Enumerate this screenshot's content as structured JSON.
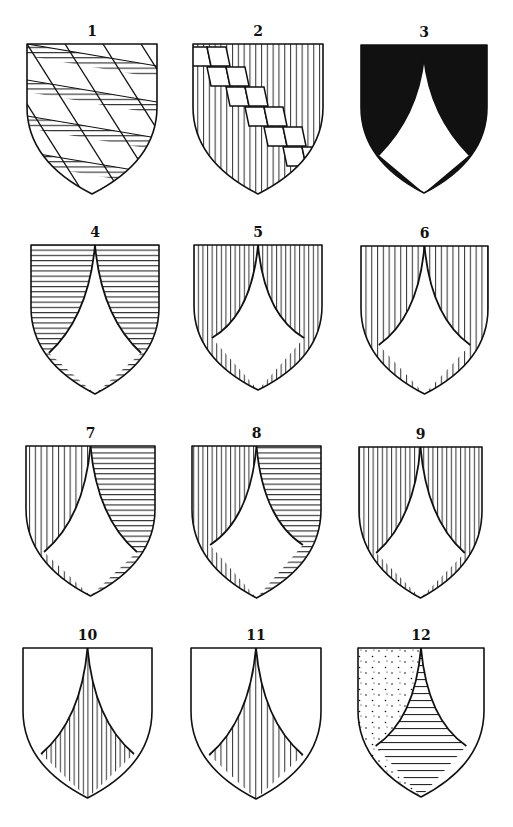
{
  "figure": {
    "ink": "#111111",
    "paper": "#ffffff",
    "shields": [
      {
        "id": 1,
        "label": "1",
        "x": 27,
        "y": 44,
        "w": 130,
        "h": 150,
        "design": "bendy-lozengy",
        "tincture": "horizontal-hatching"
      },
      {
        "id": 2,
        "label": "2",
        "x": 193,
        "y": 44,
        "w": 130,
        "h": 150,
        "design": "bend-lozengy",
        "tincture": "vertical-hatching"
      },
      {
        "id": 3,
        "label": "3",
        "x": 361,
        "y": 45,
        "w": 126,
        "h": 148,
        "design": "chape",
        "upper": "solid-black",
        "lower": "white",
        "inner_top": 13,
        "junction": 110
      },
      {
        "id": 4,
        "label": "4",
        "x": 31,
        "y": 245,
        "w": 128,
        "h": 149,
        "design": "chape",
        "upper": "horizontal-hatching",
        "lower": "white",
        "inner_top": 0,
        "junction": 108
      },
      {
        "id": 5,
        "label": "5",
        "x": 194,
        "y": 245,
        "w": 128,
        "h": 145,
        "design": "chape",
        "upper": "vertical-hatching",
        "lower": "white",
        "inner_top": 0,
        "junction": 93
      },
      {
        "id": 6,
        "label": "6",
        "x": 361,
        "y": 246,
        "w": 127,
        "h": 148,
        "design": "chape",
        "upper": "vertical-hatching-wide",
        "lower": "white",
        "inner_top": 0,
        "junction": 99
      },
      {
        "id": 7,
        "label": "7",
        "x": 26,
        "y": 446,
        "w": 129,
        "h": 150,
        "design": "chape-parted",
        "upper_left": "vertical-hatching-wide",
        "upper_right": "horizontal-hatching",
        "lower": "white",
        "inner_top": 0,
        "junction": 106
      },
      {
        "id": 8,
        "label": "8",
        "x": 192,
        "y": 446,
        "w": 129,
        "h": 152,
        "design": "chape-parted",
        "upper_left": "vertical-hatching",
        "upper_right": "horizontal-hatching",
        "lower": "white",
        "inner_top": 0,
        "junction": 99
      },
      {
        "id": 9,
        "label": "9",
        "x": 359,
        "y": 447,
        "w": 123,
        "h": 151,
        "design": "chape",
        "upper": "vertical-hatching",
        "lower": "white",
        "inner_top": 0,
        "junction": 106
      },
      {
        "id": 10,
        "label": "10",
        "x": 23,
        "y": 648,
        "w": 129,
        "h": 150,
        "design": "chape-inverse",
        "upper": "white",
        "lower": "vertical-hatching",
        "inner_top": 0,
        "junction": 106
      },
      {
        "id": 11,
        "label": "11",
        "x": 191,
        "y": 648,
        "w": 130,
        "h": 151,
        "design": "chape-inverse",
        "upper": "white",
        "lower": "vertical-hatching-wide",
        "inner_top": 0,
        "junction": 107
      },
      {
        "id": 12,
        "label": "12",
        "x": 358,
        "y": 648,
        "w": 126,
        "h": 149,
        "design": "chape-parted-inverse",
        "upper_left": "stippled",
        "upper_right": "white",
        "lower": "horizontal-hatching-wide",
        "inner_top": 0,
        "junction": 98
      }
    ]
  }
}
